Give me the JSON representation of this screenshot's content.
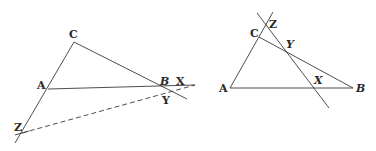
{
  "figures": [
    {
      "id": "left",
      "description": "Triangle ABC with transversal XYZ cutting all three sides externally (dashed line)",
      "points": {
        "A": {
          "label": "A",
          "x": 48,
          "y": 89
        },
        "B": {
          "label": "B",
          "x": 163,
          "y": 88
        },
        "C": {
          "label": "C",
          "x": 74,
          "y": 42
        },
        "X": {
          "label": "X",
          "x": 190,
          "y": 87
        },
        "Y": {
          "label": "Y",
          "x": 172,
          "y": 92
        },
        "Z": {
          "label": "Z",
          "x": 22,
          "y": 133
        }
      },
      "labels": {
        "A": "A",
        "B": "B",
        "C": "C",
        "X": "X",
        "Y": "Y",
        "Z": "Z"
      }
    },
    {
      "id": "right",
      "description": "Triangle ABC with transversal line through X on AB, Y on BC, Z on AC extended",
      "points": {
        "A": {
          "label": "A",
          "x": 230,
          "y": 88
        },
        "B": {
          "label": "B",
          "x": 353,
          "y": 88
        },
        "C": {
          "label": "C",
          "x": 259,
          "y": 37
        },
        "X": {
          "label": "X",
          "x": 314,
          "y": 87
        },
        "Y": {
          "label": "Y",
          "x": 287,
          "y": 51
        },
        "Z": {
          "label": "Z",
          "x": 266,
          "y": 25
        }
      },
      "labels": {
        "A": "A",
        "B": "B",
        "C": "C",
        "X": "X",
        "Y": "Y",
        "Z": "Z"
      }
    }
  ]
}
